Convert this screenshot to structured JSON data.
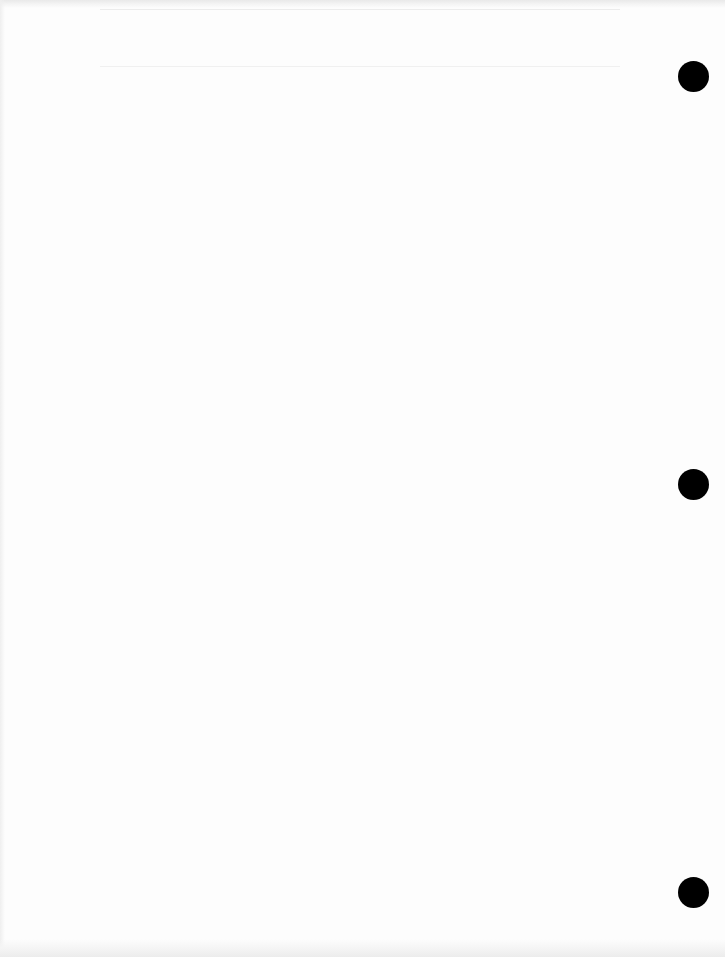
{
  "document": {
    "type": "blank-scanned-page",
    "text_content": "",
    "background_color": "#fdfdfd",
    "punch_holes": [
      {
        "cx": 693,
        "cy": 76,
        "diameter": 31,
        "color": "#000000"
      },
      {
        "cx": 693,
        "cy": 484,
        "diameter": 31,
        "color": "#000000"
      },
      {
        "cx": 693,
        "cy": 892,
        "diameter": 31,
        "color": "#000000"
      }
    ]
  }
}
